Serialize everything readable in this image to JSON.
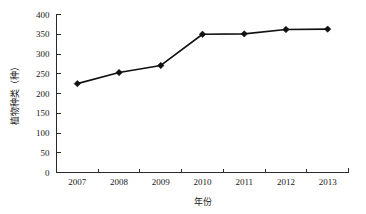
{
  "chart_data": {
    "type": "line",
    "title": "",
    "xlabel": "年份",
    "ylabel": "植物种类（种）",
    "categories": [
      "2007",
      "2008",
      "2009",
      "2010",
      "2011",
      "2012",
      "2013"
    ],
    "values": [
      225,
      253,
      271,
      350,
      351,
      362,
      363
    ],
    "series": [
      {
        "name": "植物种类（种）",
        "values": [
          225,
          253,
          271,
          350,
          351,
          362,
          363
        ]
      }
    ],
    "ylim": [
      0,
      400
    ],
    "y_ticks": [
      "0",
      "50",
      "100",
      "150",
      "200",
      "250",
      "300",
      "350",
      "400"
    ],
    "y_tick_values": [
      0,
      50,
      100,
      150,
      200,
      250,
      300,
      350,
      400
    ],
    "x_tick_labels": [
      "2007",
      "2008",
      "2009",
      "2010",
      "2011",
      "2012",
      "2013"
    ],
    "grid": false,
    "legend": "none",
    "marker": "diamond",
    "line_color": "#111111",
    "marker_color": "#111111",
    "axis_color": "#2b2b2b",
    "background": "#ffffff"
  }
}
